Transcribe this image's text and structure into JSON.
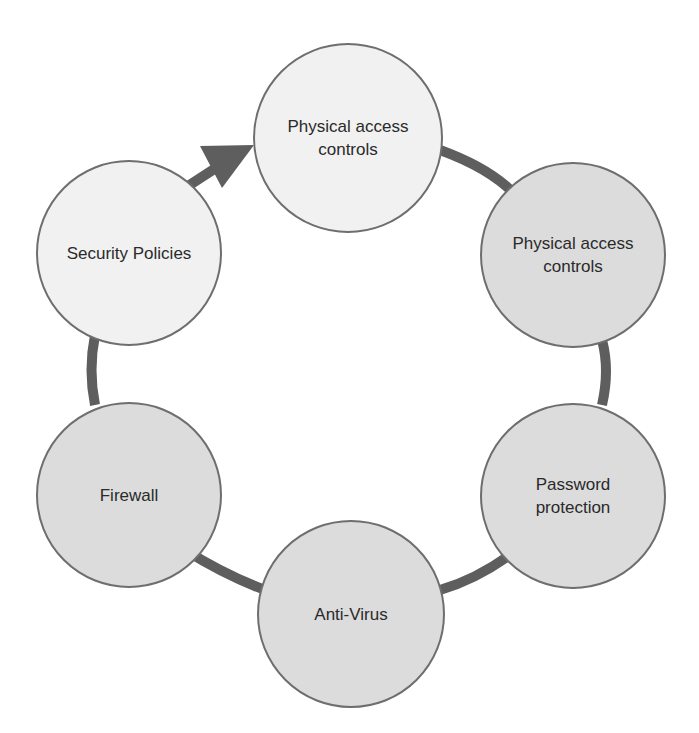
{
  "diagram": {
    "type": "cycle",
    "direction": "clockwise",
    "colors": {
      "connector": "#5e5e5e",
      "node_border": "#6e6e6e",
      "node_fill_light": "#f1f1f1",
      "node_fill_dark": "#dcdcdc",
      "text": "#2a2a2a"
    },
    "nodes": [
      {
        "label": "Physical access\ncontrols",
        "shade": "light"
      },
      {
        "label": "Physical access\ncontrols",
        "shade": "dark"
      },
      {
        "label": "Password\nprotection",
        "shade": "dark"
      },
      {
        "label": "Anti-Virus",
        "shade": "dark"
      },
      {
        "label": "Firewall",
        "shade": "dark"
      },
      {
        "label": "Security Policies",
        "shade": "light"
      }
    ],
    "arrow": {
      "from": "Security Policies",
      "to": "Physical access controls",
      "icon": "arrow-head-icon"
    }
  }
}
